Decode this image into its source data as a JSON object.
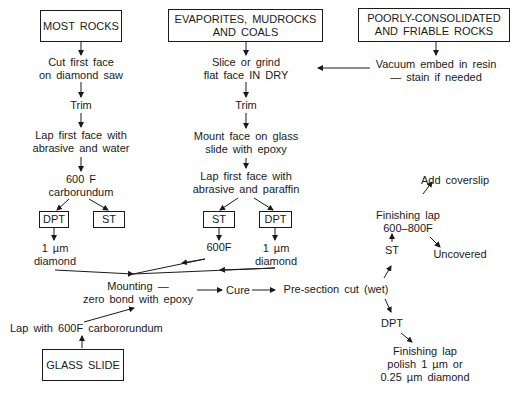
{
  "sources": {
    "most_rocks": "MOST ROCKS",
    "evaporites": [
      "EVAPORITES, MUDROCKS",
      "AND COALS"
    ],
    "poorly": [
      "POORLY-CONSOLIDATED",
      "AND FRIABLE ROCKS"
    ],
    "glass_slide": "GLASS SLIDE"
  },
  "left_column": {
    "step1": [
      "Cut first face",
      "on diamond saw"
    ],
    "step2": "Trim",
    "step3": [
      "Lap first face with",
      "abrasive and water"
    ],
    "step4": [
      "600 F",
      "carborundum"
    ],
    "dpt": "DPT",
    "st": "ST",
    "dpt_result": [
      "1 µm",
      "diamond"
    ]
  },
  "middle_column": {
    "step1": [
      "Slice or grind",
      "flat face IN DRY"
    ],
    "step2": "Trim",
    "step3": [
      "Mount face on glass",
      "slide with epoxy"
    ],
    "step4": [
      "Lap first face with",
      "abrasive and paraffin"
    ],
    "st": "ST",
    "dpt": "DPT",
    "st_result": "600F",
    "dpt_result": [
      "1 µm",
      "diamond"
    ]
  },
  "right_column": {
    "step1": [
      "Vacuum embed in resin",
      "— stain if needed"
    ]
  },
  "glass": {
    "lap": "Lap with 600F carbororundum"
  },
  "mounting": [
    "Mounting —",
    "zero bond with epoxy"
  ],
  "cure": "Cure",
  "presection": "Pre-section cut (wet)",
  "st_branch": {
    "label": "ST",
    "finishing": [
      "Finishing lap",
      "600–800F"
    ],
    "add_coverslip": "Add coverslip",
    "uncovered": "Uncovered"
  },
  "dpt_branch": {
    "label": "DPT",
    "finishing": [
      "Finishing lap",
      "polish 1 µm or",
      "0.25 µm diamond"
    ]
  }
}
